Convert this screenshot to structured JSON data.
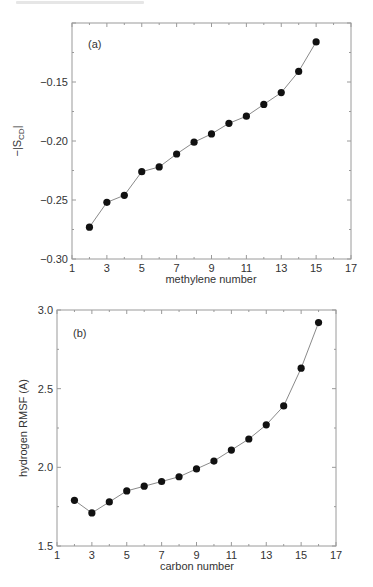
{
  "chart_data": [
    {
      "type": "line",
      "panel_label": "(a)",
      "title": "",
      "xlabel": "methylene number",
      "ylabel": "−|S",
      "ylabel_sub": "CD",
      "ylabel_end": "|",
      "xlim": [
        1,
        17
      ],
      "ylim": [
        -0.3,
        -0.1
      ],
      "xticks": [
        1,
        3,
        5,
        7,
        9,
        11,
        13,
        15,
        17
      ],
      "xtick_labels": [
        "1",
        "3",
        "5",
        "7",
        "9",
        "11",
        "13",
        "15",
        "17"
      ],
      "yticks": [
        -0.3,
        -0.25,
        -0.2,
        -0.15
      ],
      "ytick_labels": [
        "−0.30",
        "−0.25",
        "−0.20",
        "−0.15"
      ],
      "grid": false,
      "legend": null,
      "x": [
        2,
        3,
        4,
        5,
        6,
        7,
        8,
        9,
        10,
        11,
        12,
        13,
        14,
        15
      ],
      "series": [
        {
          "name": "-|S_CD|",
          "values": [
            -0.273,
            -0.252,
            -0.246,
            -0.226,
            -0.222,
            -0.211,
            -0.201,
            -0.194,
            -0.185,
            -0.179,
            -0.169,
            -0.159,
            -0.141,
            -0.116
          ]
        }
      ]
    },
    {
      "type": "line",
      "panel_label": "(b)",
      "title": "",
      "xlabel": "carbon number",
      "ylabel": "hydrogen RMSF (A)",
      "xlim": [
        1,
        17
      ],
      "ylim": [
        1.5,
        3.0
      ],
      "xticks": [
        1,
        3,
        5,
        7,
        9,
        11,
        13,
        15,
        17
      ],
      "xtick_labels": [
        "1",
        "3",
        "5",
        "7",
        "9",
        "11",
        "13",
        "15",
        "17"
      ],
      "yticks": [
        1.5,
        2.0,
        2.5,
        3.0
      ],
      "ytick_labels": [
        "1.5",
        "2.0",
        "2.5",
        "3.0"
      ],
      "grid": false,
      "legend": null,
      "x": [
        2,
        3,
        4,
        5,
        6,
        7,
        8,
        9,
        10,
        11,
        12,
        13,
        14,
        15,
        16
      ],
      "series": [
        {
          "name": "hydrogen RMSF",
          "values": [
            1.79,
            1.71,
            1.78,
            1.85,
            1.88,
            1.91,
            1.94,
            1.99,
            2.04,
            2.11,
            2.18,
            2.27,
            2.39,
            2.63,
            2.92
          ]
        }
      ]
    }
  ]
}
